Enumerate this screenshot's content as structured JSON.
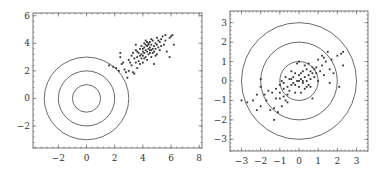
{
  "chart_data": [
    {
      "type": "scatter",
      "title": "",
      "xlabel": "",
      "ylabel": "",
      "xlim": [
        -3.8,
        8.2
      ],
      "ylim": [
        -3.6,
        6.2
      ],
      "xticks": [
        -2,
        0,
        2,
        4,
        6,
        8
      ],
      "yticks": [
        -2,
        0,
        2,
        4,
        6
      ],
      "xtick_labels": [
        "−2",
        "0",
        "2",
        "4",
        "6",
        "8"
      ],
      "ytick_labels": [
        "−2",
        "0",
        "2",
        "4",
        "6"
      ],
      "grid": false,
      "legend": null,
      "circles": [
        {
          "cx": 0,
          "cy": 0,
          "r": 1
        },
        {
          "cx": 0,
          "cy": 0,
          "r": 2
        },
        {
          "cx": 0,
          "cy": 0,
          "r": 3
        }
      ],
      "series": [
        {
          "name": "points",
          "description": "Cluster of ~120 points, correlated, centered near (4.3, 3.4), spanning x≈1.6–6.2, y≈1.5–4.7",
          "points": [
            [
              1.6,
              2.4
            ],
            [
              1.9,
              2.3
            ],
            [
              2.1,
              2.2
            ],
            [
              2.3,
              2.0
            ],
            [
              2.5,
              2.5
            ],
            [
              2.4,
              3.3
            ],
            [
              2.4,
              3.0
            ],
            [
              2.7,
              2.1
            ],
            [
              2.8,
              1.9
            ],
            [
              2.9,
              1.5
            ],
            [
              3.0,
              2.8
            ],
            [
              3.1,
              2.6
            ],
            [
              3.2,
              3.1
            ],
            [
              3.2,
              2.4
            ],
            [
              3.3,
              3.3
            ],
            [
              3.4,
              2.9
            ],
            [
              3.4,
              1.8
            ],
            [
              3.5,
              3.5
            ],
            [
              3.5,
              2.6
            ],
            [
              3.6,
              3.0
            ],
            [
              3.6,
              2.2
            ],
            [
              3.7,
              3.3
            ],
            [
              3.7,
              2.7
            ],
            [
              3.8,
              3.6
            ],
            [
              3.8,
              2.5
            ],
            [
              3.9,
              3.2
            ],
            [
              3.9,
              2.9
            ],
            [
              3.9,
              3.8
            ],
            [
              4.0,
              3.4
            ],
            [
              4.0,
              3.1
            ],
            [
              4.0,
              2.6
            ],
            [
              4.1,
              4.0
            ],
            [
              4.1,
              3.7
            ],
            [
              4.1,
              3.3
            ],
            [
              4.2,
              3.5
            ],
            [
              4.2,
              3.0
            ],
            [
              4.2,
              4.2
            ],
            [
              4.3,
              3.8
            ],
            [
              4.3,
              3.4
            ],
            [
              4.3,
              2.8
            ],
            [
              4.4,
              3.6
            ],
            [
              4.4,
              4.0
            ],
            [
              4.4,
              3.2
            ],
            [
              4.5,
              3.7
            ],
            [
              4.5,
              3.3
            ],
            [
              4.5,
              4.1
            ],
            [
              4.6,
              3.5
            ],
            [
              4.6,
              3.9
            ],
            [
              4.6,
              3.0
            ],
            [
              4.7,
              3.6
            ],
            [
              4.7,
              4.2
            ],
            [
              4.7,
              3.3
            ],
            [
              4.8,
              3.8
            ],
            [
              4.8,
              3.4
            ],
            [
              4.8,
              2.5
            ],
            [
              4.9,
              4.0
            ],
            [
              4.9,
              3.6
            ],
            [
              5.0,
              3.9
            ],
            [
              5.0,
              3.2
            ],
            [
              5.0,
              4.4
            ],
            [
              5.1,
              3.7
            ],
            [
              5.2,
              4.1
            ],
            [
              5.2,
              3.5
            ],
            [
              5.3,
              4.3
            ],
            [
              5.3,
              3.8
            ],
            [
              5.4,
              4.5
            ],
            [
              5.5,
              3.9
            ],
            [
              5.6,
              4.6
            ],
            [
              5.6,
              4.2
            ],
            [
              5.7,
              3.4
            ],
            [
              5.9,
              4.4
            ],
            [
              6.0,
              4.5
            ],
            [
              6.1,
              4.6
            ],
            [
              6.2,
              3.9
            ],
            [
              5.9,
              3.0
            ],
            [
              3.0,
              2.0
            ],
            [
              3.3,
              1.9
            ],
            [
              2.6,
              2.6
            ],
            [
              3.5,
              3.9
            ],
            [
              4.1,
              2.9
            ],
            [
              4.4,
              3.9
            ],
            [
              4.6,
              4.3
            ],
            [
              4.9,
              3.1
            ],
            [
              5.1,
              4.2
            ],
            [
              3.8,
              3.1
            ],
            [
              4.0,
              3.6
            ],
            [
              4.2,
              3.9
            ],
            [
              4.5,
              3.5
            ],
            [
              3.6,
              3.4
            ],
            [
              4.3,
              4.1
            ]
          ]
        }
      ]
    },
    {
      "type": "scatter",
      "title": "",
      "xlabel": "",
      "ylabel": "",
      "xlim": [
        -3.6,
        3.6
      ],
      "ylim": [
        -3.6,
        3.6
      ],
      "xticks": [
        -3,
        -2,
        -1,
        0,
        1,
        2,
        3
      ],
      "yticks": [
        -3,
        -2,
        -1,
        0,
        1,
        2,
        3
      ],
      "xtick_labels": [
        "−3",
        "−2",
        "−1",
        "0",
        "1",
        "2",
        "3"
      ],
      "ytick_labels": [
        "−3",
        "−2",
        "−1",
        "0",
        "1",
        "2",
        "3"
      ],
      "grid": false,
      "legend": null,
      "circles": [
        {
          "cx": 0,
          "cy": 0,
          "r": 1
        },
        {
          "cx": 0,
          "cy": 0,
          "r": 2
        },
        {
          "cx": 0,
          "cy": 0,
          "r": 3
        }
      ],
      "series": [
        {
          "name": "points",
          "description": "Same cluster after centering/whitening: ~120 points centered near origin, correlated along diagonal, spanning x≈−3–2.3, y≈−2–1.6",
          "points": [
            [
              -3.0,
              -1.0
            ],
            [
              -2.7,
              -1.1
            ],
            [
              -2.4,
              -1.0
            ],
            [
              -2.2,
              -1.5
            ],
            [
              -2.0,
              -1.3
            ],
            [
              -2.0,
              0.1
            ],
            [
              -2.0,
              -0.3
            ],
            [
              -1.8,
              -0.7
            ],
            [
              -1.7,
              -1.0
            ],
            [
              -1.6,
              -0.5
            ],
            [
              -1.4,
              -0.6
            ],
            [
              -1.3,
              -1.4
            ],
            [
              -1.3,
              -2.0
            ],
            [
              -1.2,
              -0.9
            ],
            [
              -1.2,
              -0.4
            ],
            [
              -1.1,
              -1.6
            ],
            [
              -1.0,
              -0.6
            ],
            [
              -1.0,
              -0.2
            ],
            [
              -0.9,
              -1.3
            ],
            [
              -0.9,
              0.0
            ],
            [
              -0.8,
              -0.8
            ],
            [
              -0.8,
              -0.4
            ],
            [
              -0.7,
              -1.0
            ],
            [
              -0.7,
              0.2
            ],
            [
              -0.6,
              -0.3
            ],
            [
              -0.6,
              -0.7
            ],
            [
              -0.5,
              0.1
            ],
            [
              -0.5,
              -0.5
            ],
            [
              -0.4,
              -0.2
            ],
            [
              -0.4,
              0.5
            ],
            [
              -0.3,
              0.2
            ],
            [
              -0.3,
              -0.1
            ],
            [
              -0.2,
              -0.6
            ],
            [
              -0.2,
              0.4
            ],
            [
              -0.1,
              0.0
            ],
            [
              -0.1,
              0.9
            ],
            [
              0.0,
              0.3
            ],
            [
              0.0,
              -0.3
            ],
            [
              0.0,
              1.0
            ],
            [
              0.1,
              0.1
            ],
            [
              0.1,
              -0.6
            ],
            [
              0.2,
              0.5
            ],
            [
              0.2,
              -0.1
            ],
            [
              0.3,
              0.8
            ],
            [
              0.3,
              0.2
            ],
            [
              0.3,
              -0.4
            ],
            [
              0.4,
              0.0
            ],
            [
              0.4,
              0.6
            ],
            [
              0.5,
              0.3
            ],
            [
              0.5,
              -0.2
            ],
            [
              0.5,
              0.9
            ],
            [
              0.6,
              0.1
            ],
            [
              0.6,
              0.5
            ],
            [
              0.7,
              -0.9
            ],
            [
              0.7,
              0.4
            ],
            [
              0.8,
              0.6
            ],
            [
              0.8,
              0.2
            ],
            [
              0.9,
              0.7
            ],
            [
              1.0,
              0.0
            ],
            [
              1.0,
              1.1
            ],
            [
              1.1,
              0.5
            ],
            [
              1.2,
              0.8
            ],
            [
              1.2,
              1.3
            ],
            [
              1.3,
              0.3
            ],
            [
              1.4,
              1.0
            ],
            [
              1.5,
              1.5
            ],
            [
              1.6,
              0.6
            ],
            [
              1.6,
              -0.1
            ],
            [
              1.7,
              1.1
            ],
            [
              1.8,
              0.4
            ],
            [
              2.0,
              1.3
            ],
            [
              2.1,
              -0.3
            ],
            [
              2.2,
              1.4
            ],
            [
              2.3,
              1.5
            ],
            [
              2.3,
              0.8
            ],
            [
              -1.5,
              -1.5
            ],
            [
              -2.2,
              -0.7
            ],
            [
              -0.6,
              -1.1
            ],
            [
              0.9,
              0.4
            ],
            [
              0.2,
              0.0
            ],
            [
              -0.4,
              0.1
            ],
            [
              0.4,
              -0.3
            ],
            [
              0.0,
              0.0
            ],
            [
              0.1,
              0.4
            ],
            [
              -0.2,
              -0.2
            ],
            [
              0.7,
              0.7
            ],
            [
              1.3,
              1.2
            ],
            [
              -1.0,
              -0.9
            ],
            [
              0.6,
              -0.3
            ],
            [
              -0.8,
              -0.1
            ]
          ]
        }
      ]
    }
  ]
}
